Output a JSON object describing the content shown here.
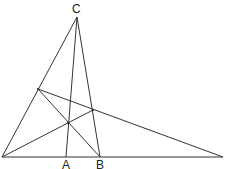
{
  "diagram": {
    "type": "geometry-triangle-cevians",
    "stroke_color": "#333333",
    "background": "#ffffff",
    "points": {
      "P": {
        "x": 2,
        "y": 157
      },
      "Q": {
        "x": 223,
        "y": 157
      },
      "C": {
        "x": 77,
        "y": 17
      },
      "A": {
        "x": 66,
        "y": 157
      },
      "B": {
        "x": 100,
        "y": 157
      },
      "D": {
        "x": 38,
        "y": 89
      },
      "E": {
        "x": 93,
        "y": 110
      },
      "O": {
        "x": 68,
        "y": 123
      }
    },
    "segments": [
      {
        "from": "P",
        "to": "Q"
      },
      {
        "from": "P",
        "to": "C"
      },
      {
        "from": "C",
        "to": "A"
      },
      {
        "from": "C",
        "to": "B"
      },
      {
        "from": "D",
        "to": "Q"
      },
      {
        "from": "D",
        "to": "B"
      },
      {
        "from": "P",
        "to": "E"
      }
    ],
    "labels": {
      "C": {
        "text": "C",
        "x": 72,
        "y": 3
      },
      "A": {
        "text": "A",
        "x": 62,
        "y": 159
      },
      "B": {
        "text": "B",
        "x": 96,
        "y": 159
      }
    }
  }
}
